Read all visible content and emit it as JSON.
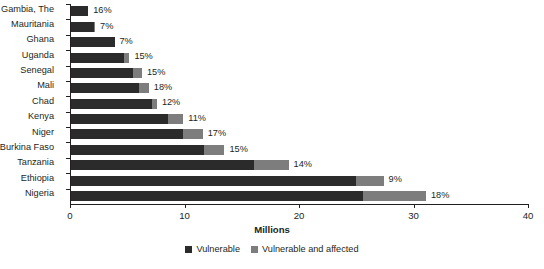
{
  "chart_data": {
    "type": "bar",
    "orientation": "horizontal",
    "stacked": true,
    "title": "",
    "xlabel": "Millions",
    "ylabel": "",
    "xlim": [
      0,
      40
    ],
    "xticks": [
      "0",
      "10",
      "20",
      "30",
      "40"
    ],
    "grid": false,
    "legend_position": "bottom",
    "categories": [
      "Gambia, The",
      "Mauritania",
      "Ghana",
      "Uganda",
      "Senegal",
      "Mali",
      "Chad",
      "Kenya",
      "Niger",
      "Burkina Faso",
      "Tanzania",
      "Ethiopia",
      "Nigeria"
    ],
    "series": [
      {
        "name": "Vulnerable",
        "color": "#2b2b2b",
        "values": [
          1.5,
          2.0,
          3.8,
          4.6,
          5.4,
          5.9,
          7.1,
          8.5,
          9.8,
          11.6,
          16.0,
          24.9,
          25.5
        ]
      },
      {
        "name": "Vulnerable and affected",
        "color": "#7d7d7d",
        "values": [
          0.0,
          0.1,
          0.0,
          0.5,
          0.8,
          0.9,
          0.4,
          1.3,
          1.7,
          1.8,
          3.0,
          2.4,
          5.5
        ]
      }
    ],
    "point_labels": [
      "16%",
      "7%",
      "7%",
      "15%",
      "15%",
      "18%",
      "12%",
      "11%",
      "17%",
      "15%",
      "14%",
      "9%",
      "18%"
    ]
  },
  "legend": {
    "items": [
      {
        "label": "Vulnerable",
        "color": "#2b2b2b"
      },
      {
        "label": "Vulnerable and affected",
        "color": "#7d7d7d"
      }
    ]
  },
  "axis": {
    "x_title": "Millions"
  }
}
